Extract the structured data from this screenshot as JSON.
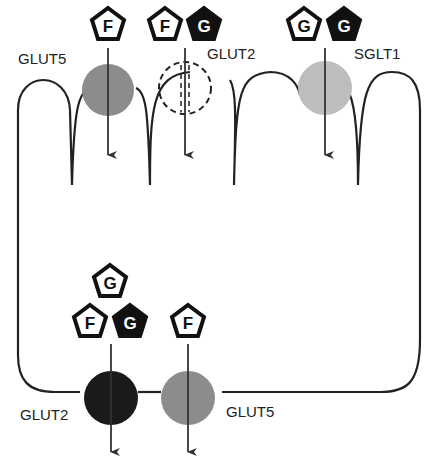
{
  "diagram": {
    "type": "enterocyte sugar transport",
    "apical_transporters": [
      {
        "name": "GLUT5",
        "label": "GLUT5",
        "substrates": [
          "F"
        ]
      },
      {
        "name": "GLUT2",
        "label": "GLUT2",
        "substrates": [
          "F",
          "G"
        ],
        "style": "dashed"
      },
      {
        "name": "SGLT1",
        "label": "SGLT1",
        "substrates": [
          "G",
          "G"
        ]
      }
    ],
    "basolateral_transporters": [
      {
        "name": "GLUT2",
        "label": "GLUT2",
        "substrates": [
          "G",
          "F",
          "G"
        ]
      },
      {
        "name": "GLUT5",
        "label": "GLUT5",
        "substrates": [
          "F"
        ]
      }
    ],
    "legend": {
      "F": "Fructose",
      "G": "Glucose"
    },
    "colors": {
      "glut5": "#8c8c8c",
      "sglt1": "#bdbdbd",
      "glut2_baso": "#1a1a1a",
      "line": "#222222"
    }
  },
  "labels": {
    "glut5_apical": "GLUT5",
    "glut2_apical": "GLUT2",
    "sglt1": "SGLT1",
    "glut2_baso": "GLUT2",
    "glut5_baso": "GLUT5"
  },
  "glyphs": {
    "F": "F",
    "G": "G"
  }
}
